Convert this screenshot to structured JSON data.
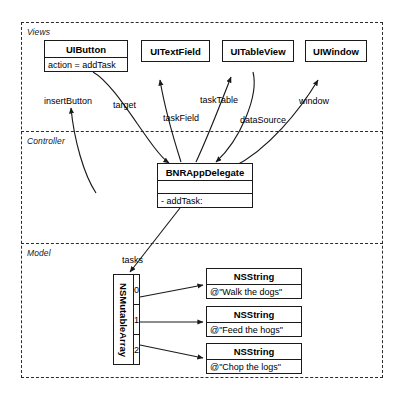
{
  "diagram": {
    "type": "mvc-object-diagram",
    "tiers": [
      {
        "name": "views",
        "label": "Views"
      },
      {
        "name": "controller",
        "label": "Controller"
      },
      {
        "name": "model",
        "label": "Model"
      }
    ],
    "views": {
      "boxes": [
        {
          "name": "uibutton",
          "title": "UIButton",
          "attributes": [
            "action = addTask"
          ]
        },
        {
          "name": "uitextfield",
          "title": "UITextField",
          "attributes": []
        },
        {
          "name": "uitableview",
          "title": "UITableView",
          "attributes": []
        },
        {
          "name": "uiwindow",
          "title": "UIWindow",
          "attributes": []
        }
      ]
    },
    "controller": {
      "box": {
        "name": "bnrappdelegate",
        "title": "BNRAppDelegate",
        "attributes": [
          ""
        ],
        "methods": [
          "- addTask:"
        ]
      }
    },
    "model": {
      "array": {
        "name": "nsmutablearray",
        "class_label": "NSMutableArray",
        "indices": [
          "0",
          "1",
          "2"
        ]
      },
      "strings": [
        {
          "name": "nsstring-0",
          "title": "NSString",
          "value": "@\"Walk the dogs\""
        },
        {
          "name": "nsstring-1",
          "title": "NSString",
          "value": "@\"Feed the hogs\""
        },
        {
          "name": "nsstring-2",
          "title": "NSString",
          "value": "@\"Chop the logs\""
        }
      ]
    },
    "connections": [
      {
        "name": "insertButton",
        "label": "insertButton"
      },
      {
        "name": "target",
        "label": "target"
      },
      {
        "name": "taskField",
        "label": "taskField"
      },
      {
        "name": "taskTable",
        "label": "taskTable"
      },
      {
        "name": "dataSource",
        "label": "dataSource"
      },
      {
        "name": "window",
        "label": "window"
      },
      {
        "name": "tasks",
        "label": "tasks"
      }
    ],
    "colors": {
      "stroke": "#1a1a1a",
      "partition": "#2b2b2b",
      "background": "#ffffff"
    }
  }
}
